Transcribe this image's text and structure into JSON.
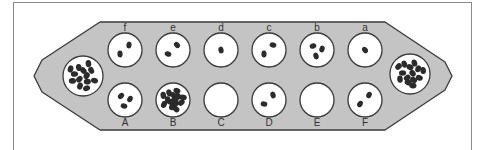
{
  "colors": {
    "board_fill": "#c4c4c4",
    "board_stroke": "#3a3a3a",
    "pit_fill": "#ffffff",
    "seed": "#2b2b2b",
    "frame": "#8a8a8a"
  },
  "board": {
    "top_row": [
      {
        "label": "f",
        "seeds": 2
      },
      {
        "label": "e",
        "seeds": 2
      },
      {
        "label": "d",
        "seeds": 1
      },
      {
        "label": "c",
        "seeds": 2
      },
      {
        "label": "b",
        "seeds": 3
      },
      {
        "label": "a",
        "seeds": 1
      }
    ],
    "bottom_row": [
      {
        "label": "A",
        "seeds": 3
      },
      {
        "label": "B",
        "seeds": 14
      },
      {
        "label": "C",
        "seeds": 0
      },
      {
        "label": "D",
        "seeds": 2
      },
      {
        "label": "E",
        "seeds": 0
      },
      {
        "label": "F",
        "seeds": 2
      }
    ],
    "left_store": {
      "seeds": 13
    },
    "right_store": {
      "seeds": 14
    }
  }
}
